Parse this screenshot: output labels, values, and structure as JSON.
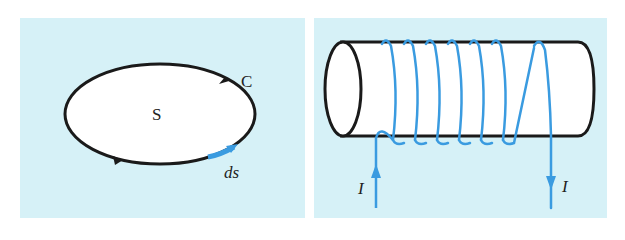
{
  "figure": {
    "left_panel": {
      "description": "Closed curve C bounding surface S with line element ds",
      "labels": {
        "surface": "S",
        "curve": "C",
        "line_element": "ds"
      },
      "colors": {
        "background": "#d6f1f7",
        "fill": "#ffffff",
        "curve": "#1a1a1a",
        "line_element": "#3a9be0"
      }
    },
    "right_panel": {
      "description": "Solenoid: wire coiled around a cylinder carrying current I",
      "labels": {
        "current_in": "I",
        "current_out": "I"
      },
      "turns": 7,
      "colors": {
        "background": "#d6f1f7",
        "cylinder_fill": "#ffffff",
        "cylinder_outline": "#1a1a1a",
        "wire": "#3a9be0"
      }
    }
  }
}
